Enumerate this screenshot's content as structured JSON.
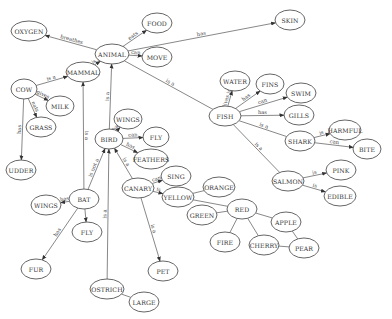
{
  "diagram": {
    "type": "semantic-network",
    "nodes": [
      {
        "id": "OXYGEN",
        "label": "OXYGEN",
        "x": 29,
        "y": 31,
        "rx": 18,
        "ry": 10
      },
      {
        "id": "FOOD",
        "label": "FOOD",
        "x": 157,
        "y": 23,
        "rx": 15,
        "ry": 10
      },
      {
        "id": "SKIN",
        "label": "SKIN",
        "x": 290,
        "y": 20,
        "rx": 15,
        "ry": 10
      },
      {
        "id": "ANIMAL",
        "label": "ANIMAL",
        "x": 112,
        "y": 54,
        "rx": 17,
        "ry": 10
      },
      {
        "id": "MOVE",
        "label": "MOVE",
        "x": 157,
        "y": 57,
        "rx": 15,
        "ry": 10
      },
      {
        "id": "MAMMAL",
        "label": "MAMMAL",
        "x": 83,
        "y": 72,
        "rx": 17,
        "ry": 10
      },
      {
        "id": "COW",
        "label": "COW",
        "x": 24,
        "y": 89,
        "rx": 13,
        "ry": 10
      },
      {
        "id": "MILK",
        "label": "MILK",
        "x": 60,
        "y": 106,
        "rx": 14,
        "ry": 10
      },
      {
        "id": "GRASS",
        "label": "GRASS",
        "x": 41,
        "y": 127,
        "rx": 15,
        "ry": 10
      },
      {
        "id": "UDDER",
        "label": "UDDER",
        "x": 21,
        "y": 170,
        "rx": 15,
        "ry": 10
      },
      {
        "id": "WATER",
        "label": "WATER",
        "x": 235,
        "y": 81,
        "rx": 15,
        "ry": 10
      },
      {
        "id": "FINS",
        "label": "FINS",
        "x": 270,
        "y": 84,
        "rx": 14,
        "ry": 10
      },
      {
        "id": "SWIM",
        "label": "SWIM",
        "x": 301,
        "y": 93,
        "rx": 15,
        "ry": 10
      },
      {
        "id": "FISH",
        "label": "FISH",
        "x": 225,
        "y": 116,
        "rx": 16,
        "ry": 10
      },
      {
        "id": "GILLS",
        "label": "GILLS",
        "x": 299,
        "y": 115,
        "rx": 15,
        "ry": 10
      },
      {
        "id": "WINGS_BIRD",
        "label": "WINGS",
        "x": 128,
        "y": 119,
        "rx": 14,
        "ry": 10
      },
      {
        "id": "BIRD",
        "label": "BIRD",
        "x": 109,
        "y": 139,
        "rx": 14,
        "ry": 10
      },
      {
        "id": "FLY_BIRD",
        "label": "FLY",
        "x": 156,
        "y": 137,
        "rx": 13,
        "ry": 10
      },
      {
        "id": "FEATHERS",
        "label": "FEATHERS",
        "x": 151,
        "y": 159,
        "rx": 17,
        "ry": 10
      },
      {
        "id": "HARMFUL",
        "label": "HARMFUL",
        "x": 345,
        "y": 130,
        "rx": 16,
        "ry": 10
      },
      {
        "id": "SHARK",
        "label": "SHARK",
        "x": 300,
        "y": 141,
        "rx": 15,
        "ry": 10
      },
      {
        "id": "BITE",
        "label": "BITE",
        "x": 367,
        "y": 149,
        "rx": 14,
        "ry": 10
      },
      {
        "id": "SING",
        "label": "SING",
        "x": 176,
        "y": 176,
        "rx": 15,
        "ry": 10
      },
      {
        "id": "CANARY",
        "label": "CANARY",
        "x": 138,
        "y": 188,
        "rx": 16,
        "ry": 10
      },
      {
        "id": "YELLOW",
        "label": "YELLOW",
        "x": 178,
        "y": 197,
        "rx": 16,
        "ry": 10
      },
      {
        "id": "ORANGE",
        "label": "ORANGE",
        "x": 219,
        "y": 187,
        "rx": 16,
        "ry": 10
      },
      {
        "id": "SALMON",
        "label": "SALMON",
        "x": 288,
        "y": 181,
        "rx": 16,
        "ry": 10
      },
      {
        "id": "PINK",
        "label": "PINK",
        "x": 341,
        "y": 170,
        "rx": 15,
        "ry": 10
      },
      {
        "id": "EDIBLE",
        "label": "EDIBLE",
        "x": 340,
        "y": 196,
        "rx": 16,
        "ry": 10
      },
      {
        "id": "WINGS_BAT",
        "label": "WINGS",
        "x": 46,
        "y": 205,
        "rx": 15,
        "ry": 10
      },
      {
        "id": "BAT",
        "label": "BAT",
        "x": 84,
        "y": 199,
        "rx": 15,
        "ry": 10
      },
      {
        "id": "GREEN",
        "label": "GREEN",
        "x": 202,
        "y": 215,
        "rx": 15,
        "ry": 10
      },
      {
        "id": "RED",
        "label": "RED",
        "x": 242,
        "y": 209,
        "rx": 15,
        "ry": 10
      },
      {
        "id": "APPLE",
        "label": "APPLE",
        "x": 286,
        "y": 222,
        "rx": 15,
        "ry": 10
      },
      {
        "id": "FLY_BAT",
        "label": "FLY",
        "x": 87,
        "y": 232,
        "rx": 15,
        "ry": 10
      },
      {
        "id": "FIRE",
        "label": "FIRE",
        "x": 225,
        "y": 242,
        "rx": 15,
        "ry": 10
      },
      {
        "id": "CHERRY",
        "label": "CHERRY",
        "x": 264,
        "y": 245,
        "rx": 15,
        "ry": 10
      },
      {
        "id": "PEAR",
        "label": "PEAR",
        "x": 304,
        "y": 248,
        "rx": 15,
        "ry": 10
      },
      {
        "id": "FUR",
        "label": "FUR",
        "x": 36,
        "y": 269,
        "rx": 15,
        "ry": 10
      },
      {
        "id": "PET",
        "label": "PET",
        "x": 163,
        "y": 271,
        "rx": 15,
        "ry": 10
      },
      {
        "id": "OSTRICH",
        "label": "OSTRICH",
        "x": 107,
        "y": 289,
        "rx": 17,
        "ry": 10
      },
      {
        "id": "LARGE",
        "label": "LARGE",
        "x": 144,
        "y": 302,
        "rx": 15,
        "ry": 10
      }
    ],
    "edges": [
      {
        "from": "ANIMAL",
        "to": "OXYGEN",
        "label": "breathes",
        "arrow": true
      },
      {
        "from": "ANIMAL",
        "to": "FOOD",
        "label": "eats",
        "arrow": true
      },
      {
        "from": "ANIMAL",
        "to": "SKIN",
        "label": "has",
        "arrow": true
      },
      {
        "from": "ANIMAL",
        "to": "MOVE",
        "label": "can",
        "arrow": true
      },
      {
        "from": "MAMMAL",
        "to": "ANIMAL",
        "label": "is a",
        "arrow": true
      },
      {
        "from": "FISH",
        "to": "ANIMAL",
        "label": "is a",
        "arrow": false
      },
      {
        "from": "BIRD",
        "to": "ANIMAL",
        "label": "is a",
        "arrow": true
      },
      {
        "from": "COW",
        "to": "MAMMAL",
        "label": "is a",
        "arrow": true
      },
      {
        "from": "COW",
        "to": "MILK",
        "label": "gives",
        "arrow": true
      },
      {
        "from": "COW",
        "to": "GRASS",
        "label": "eats",
        "arrow": true
      },
      {
        "from": "COW",
        "to": "UDDER",
        "label": "has",
        "arrow": true
      },
      {
        "from": "BAT",
        "to": "MAMMAL",
        "label": "is a",
        "arrow": true
      },
      {
        "from": "BAT",
        "to": "BIRD",
        "label": "is not a",
        "arrow": true
      },
      {
        "from": "BAT",
        "to": "WINGS_BAT",
        "label": "has",
        "arrow": true
      },
      {
        "from": "BAT",
        "to": "FLY_BAT",
        "label": "",
        "arrow": true
      },
      {
        "from": "BAT",
        "to": "FUR",
        "label": "has",
        "arrow": true
      },
      {
        "from": "FISH",
        "to": "WATER",
        "label": "lives in",
        "arrow": true
      },
      {
        "from": "FISH",
        "to": "FINS",
        "label": "has",
        "arrow": true
      },
      {
        "from": "FISH",
        "to": "SWIM",
        "label": "can",
        "arrow": true
      },
      {
        "from": "FISH",
        "to": "GILLS",
        "label": "has",
        "arrow": true
      },
      {
        "from": "SHARK",
        "to": "FISH",
        "label": "is a",
        "arrow": false
      },
      {
        "from": "SALMON",
        "to": "FISH",
        "label": "is a",
        "arrow": false
      },
      {
        "from": "SHARK",
        "to": "HARMFUL",
        "label": "is",
        "arrow": true
      },
      {
        "from": "SHARK",
        "to": "BITE",
        "label": "can",
        "arrow": true
      },
      {
        "from": "SALMON",
        "to": "PINK",
        "label": "is",
        "arrow": true
      },
      {
        "from": "SALMON",
        "to": "EDIBLE",
        "label": "is",
        "arrow": true
      },
      {
        "from": "BIRD",
        "to": "WINGS_BIRD",
        "label": "has",
        "arrow": true
      },
      {
        "from": "BIRD",
        "to": "FLY_BIRD",
        "label": "can",
        "arrow": true
      },
      {
        "from": "BIRD",
        "to": "FEATHERS",
        "label": "has",
        "arrow": true
      },
      {
        "from": "CANARY",
        "to": "BIRD",
        "label": "is a",
        "arrow": true
      },
      {
        "from": "OSTRICH",
        "to": "BIRD",
        "label": "is a",
        "arrow": true
      },
      {
        "from": "CANARY",
        "to": "SING",
        "label": "can",
        "arrow": true
      },
      {
        "from": "CANARY",
        "to": "YELLOW",
        "label": "is",
        "arrow": true
      },
      {
        "from": "CANARY",
        "to": "PET",
        "label": "is a",
        "arrow": true
      },
      {
        "from": "OSTRICH",
        "to": "LARGE",
        "label": "",
        "arrow": false
      },
      {
        "from": "YELLOW",
        "to": "ORANGE",
        "label": "",
        "arrow": false
      },
      {
        "from": "YELLOW",
        "to": "RED",
        "label": "",
        "arrow": false
      },
      {
        "from": "GREEN",
        "to": "RED",
        "label": "",
        "arrow": false
      },
      {
        "from": "RED",
        "to": "APPLE",
        "label": "",
        "arrow": false
      },
      {
        "from": "RED",
        "to": "FIRE",
        "label": "",
        "arrow": false
      },
      {
        "from": "RED",
        "to": "CHERRY",
        "label": "",
        "arrow": false
      },
      {
        "from": "APPLE",
        "to": "PEAR",
        "label": "",
        "arrow": false
      },
      {
        "from": "CHERRY",
        "to": "PEAR",
        "label": "",
        "arrow": false
      }
    ]
  }
}
